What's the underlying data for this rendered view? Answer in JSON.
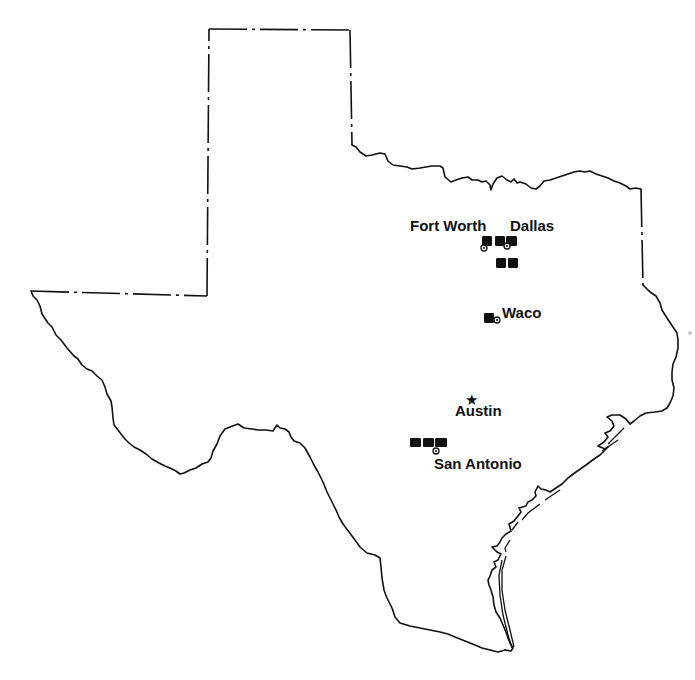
{
  "map": {
    "subject": "Texas",
    "background": "#ffffff",
    "line_color": "#111111",
    "capital": {
      "name": "Austin",
      "icon": "star-icon",
      "x": 472,
      "y": 399
    },
    "cities": [
      {
        "name": "Fort Worth",
        "label_x": 410,
        "label_y": 231
      },
      {
        "name": "Dallas",
        "label_x": 510,
        "label_y": 231
      },
      {
        "name": "Waco",
        "label_x": 502,
        "label_y": 318
      },
      {
        "name": "Austin",
        "label_x": 455,
        "label_y": 416
      },
      {
        "name": "San Antonio",
        "label_x": 434,
        "label_y": 469
      }
    ],
    "markers": [
      {
        "city": "Fort Worth",
        "x": 482,
        "y": 236,
        "w": 10,
        "h": 10,
        "ring": true,
        "ring_x": 484,
        "ring_y": 248
      },
      {
        "city": "Dallas",
        "x": 495,
        "y": 236,
        "w": 10,
        "h": 10,
        "ring": false
      },
      {
        "city": "Dallas",
        "x": 506,
        "y": 236,
        "w": 11,
        "h": 10,
        "ring": true,
        "ring_x": 507,
        "ring_y": 246
      },
      {
        "city": "Dallas",
        "x": 496,
        "y": 258,
        "w": 10,
        "h": 10,
        "ring": false
      },
      {
        "city": "Dallas",
        "x": 508,
        "y": 258,
        "w": 10,
        "h": 10,
        "ring": false
      },
      {
        "city": "Waco",
        "x": 484,
        "y": 313,
        "w": 10,
        "h": 10,
        "ring": true,
        "ring_x": 497,
        "ring_y": 320
      },
      {
        "city": "San Antonio",
        "x": 410,
        "y": 438,
        "w": 11,
        "h": 9,
        "ring": false
      },
      {
        "city": "San Antonio",
        "x": 423,
        "y": 438,
        "w": 11,
        "h": 9,
        "ring": false
      },
      {
        "city": "San Antonio",
        "x": 435,
        "y": 438,
        "w": 12,
        "h": 9,
        "ring": true,
        "ring_x": 436,
        "ring_y": 451
      }
    ]
  }
}
